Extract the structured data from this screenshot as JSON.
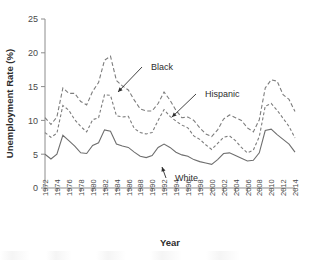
{
  "chart_data": {
    "type": "line",
    "title": "",
    "xlabel": "Year",
    "ylabel": "Unemployment Rate (%)",
    "xlim": [
      1972,
      2014
    ],
    "ylim": [
      0,
      25
    ],
    "yticks": [
      0,
      5,
      10,
      15,
      20,
      25
    ],
    "ytick_labels": [
      "0",
      "5",
      "10",
      "15",
      "20",
      "25"
    ],
    "xtick_labels": [
      "1972",
      "1974",
      "1976",
      "1978",
      "1980",
      "1982",
      "1984",
      "1986",
      "1988",
      "1990",
      "1992",
      "1994",
      "1996",
      "1998",
      "2000",
      "2002",
      "2004",
      "2006",
      "2008",
      "2010",
      "2012",
      "2014"
    ],
    "grid": false,
    "legend_position": "inline-annotations",
    "x": [
      1972,
      1973,
      1974,
      1975,
      1976,
      1977,
      1978,
      1979,
      1980,
      1981,
      1982,
      1983,
      1984,
      1985,
      1986,
      1987,
      1988,
      1989,
      1990,
      1991,
      1992,
      1993,
      1994,
      1995,
      1996,
      1997,
      1998,
      1999,
      2000,
      2001,
      2002,
      2003,
      2004,
      2005,
      2006,
      2007,
      2008,
      2009,
      2010,
      2011,
      2012,
      2013,
      2014
    ],
    "series": [
      {
        "name": "Black",
        "style": "dashed",
        "color": "#7d7d7d",
        "values": [
          10.4,
          9.4,
          10.5,
          14.8,
          14.0,
          14.0,
          12.8,
          12.3,
          14.3,
          15.6,
          18.9,
          19.5,
          15.9,
          15.1,
          14.5,
          13.0,
          11.7,
          11.4,
          11.4,
          12.5,
          14.2,
          13.0,
          11.5,
          10.4,
          10.5,
          10.0,
          8.9,
          8.0,
          7.6,
          8.6,
          10.2,
          10.8,
          10.4,
          10.0,
          8.9,
          8.3,
          10.1,
          14.8,
          16.0,
          15.8,
          13.8,
          13.1,
          11.3
        ]
      },
      {
        "name": "Hispanic",
        "style": "dashed",
        "color": "#7d7d7d",
        "values": [
          8.2,
          7.5,
          8.1,
          12.2,
          11.5,
          10.1,
          9.1,
          8.3,
          10.1,
          10.4,
          13.8,
          13.7,
          10.7,
          10.5,
          10.6,
          8.8,
          8.2,
          8.0,
          8.2,
          10.0,
          11.6,
          10.6,
          9.9,
          9.3,
          8.9,
          7.7,
          7.2,
          6.4,
          5.7,
          6.6,
          7.5,
          7.7,
          7.0,
          6.0,
          5.2,
          5.6,
          7.6,
          12.1,
          12.5,
          11.5,
          10.3,
          9.1,
          7.4
        ]
      },
      {
        "name": "White",
        "style": "solid",
        "color": "#6e6e6e",
        "values": [
          5.0,
          4.3,
          5.0,
          7.8,
          7.0,
          6.2,
          5.2,
          5.1,
          6.3,
          6.7,
          8.6,
          8.4,
          6.5,
          6.2,
          6.0,
          5.3,
          4.7,
          4.5,
          4.8,
          6.0,
          6.5,
          6.0,
          5.3,
          4.9,
          4.7,
          4.2,
          3.9,
          3.7,
          3.5,
          4.2,
          5.1,
          5.2,
          4.8,
          4.4,
          4.0,
          4.1,
          5.2,
          8.5,
          8.7,
          7.9,
          7.2,
          6.5,
          5.3
        ]
      }
    ],
    "annotations": [
      {
        "label": "Black",
        "label_x": 151,
        "label_y": 70,
        "arrow_to_x": 118,
        "arrow_to_y": 92
      },
      {
        "label": "Hispanic",
        "label_x": 205,
        "label_y": 97,
        "arrow_to_x": 172,
        "arrow_to_y": 117
      },
      {
        "label": "White",
        "label_x": 175,
        "label_y": 181,
        "arrow_to_x": 162,
        "arrow_to_y": 167
      }
    ]
  }
}
